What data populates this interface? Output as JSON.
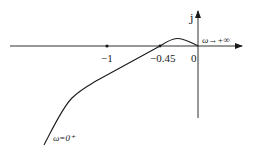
{
  "diagram": {
    "type": "nyquist-plot",
    "axes": {
      "imaginary_label": "j",
      "origin_label": "0"
    },
    "points": [
      {
        "label": "−1",
        "value": -1
      },
      {
        "label": "−0.45",
        "value": -0.45
      }
    ],
    "annotations": {
      "start": "ω=0⁺",
      "end": "ω→+∞"
    },
    "colors": {
      "stroke": "#1a1a1a"
    }
  }
}
